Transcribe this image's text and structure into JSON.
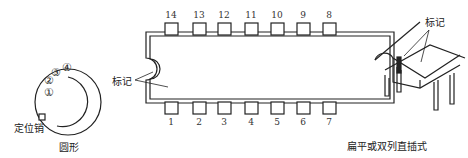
{
  "round_package": {
    "pin_labels": [
      "①",
      "②",
      "③",
      "④"
    ],
    "locating_pin_label": "定位销",
    "caption": "圆形"
  },
  "dip_package": {
    "top_pins": [
      "14",
      "13",
      "12",
      "11",
      "10",
      "9",
      "8"
    ],
    "bottom_pins": [
      "1",
      "2",
      "3",
      "4",
      "5",
      "6",
      "7"
    ],
    "mark_label": "标记"
  },
  "dip_3d": {
    "mark_label": "标记",
    "caption": "扁平或双列直插式"
  }
}
